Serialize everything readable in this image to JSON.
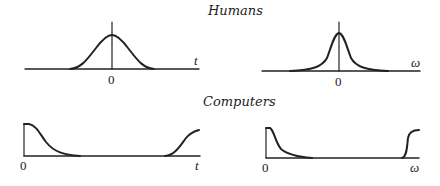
{
  "titles": {
    "top": "Humans",
    "bottom": "Computers"
  },
  "panels": {
    "humans_time": {
      "origin_label": "0",
      "axis_label": "t"
    },
    "humans_freq": {
      "origin_label": "0",
      "axis_label": "ω"
    },
    "computers_time": {
      "origin_label": "0",
      "axis_label": "t"
    },
    "computers_freq": {
      "origin_label": "0",
      "axis_label": "ω"
    }
  },
  "colors": {
    "stroke": "#222222",
    "background": "#ffffff"
  }
}
